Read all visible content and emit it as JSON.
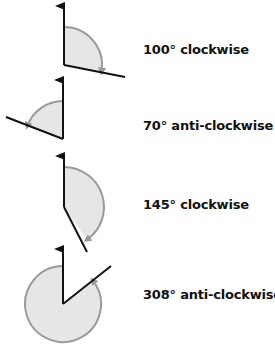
{
  "colors": {
    "line": "#111111",
    "arc": "#9a9a9a",
    "fill": "#e6e6e6"
  },
  "rotations": [
    {
      "label": "100° clockwise",
      "angle": 100,
      "direction": "clockwise"
    },
    {
      "label": "70° anti-clockwise",
      "angle": 70,
      "direction": "anti-clockwise"
    },
    {
      "label": "145° clockwise",
      "angle": 145,
      "direction": "clockwise"
    },
    {
      "label": "308° anti-clockwise",
      "angle": 308,
      "direction": "anti-clockwise"
    }
  ]
}
